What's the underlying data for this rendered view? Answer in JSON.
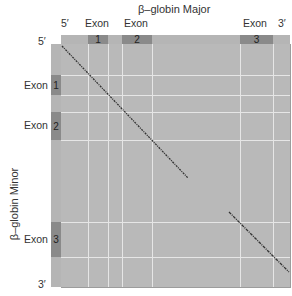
{
  "diagram": {
    "type": "dot-plot",
    "x_axis": {
      "title": "β–globin Major",
      "end_labels": {
        "start": "5′",
        "end": "3′"
      },
      "exons": [
        {
          "label": "Exon",
          "number": "1",
          "x_start": 88,
          "x_end": 108
        },
        {
          "label": "Exon",
          "number": "2",
          "x_start": 122,
          "x_end": 152
        },
        {
          "label": "Exon",
          "number": "3",
          "x_start": 240,
          "x_end": 273
        }
      ]
    },
    "y_axis": {
      "title": "β–globin Minor",
      "end_labels": {
        "start": "5′",
        "end": "3′"
      },
      "exons": [
        {
          "label": "Exon",
          "number": "1",
          "y_start": 75,
          "y_end": 95
        },
        {
          "label": "Exon",
          "number": "2",
          "y_start": 112,
          "y_end": 140
        },
        {
          "label": "Exon",
          "number": "3",
          "y_start": 222,
          "y_end": 257
        }
      ]
    },
    "alignment_segments": [
      {
        "from": [
          62,
          46
        ],
        "to": [
          188,
          178
        ],
        "style": "dotted-diagonal"
      },
      {
        "from": [
          229,
          212
        ],
        "to": [
          289,
          272
        ],
        "style": "dotted-diagonal"
      }
    ],
    "colors": {
      "plot_bg": "#b9b9b9",
      "band_bg": "#b5b5b5",
      "exon_bg": "#8a8a8a",
      "grid_line": "#e6e6e6",
      "dot": "#333333"
    }
  }
}
